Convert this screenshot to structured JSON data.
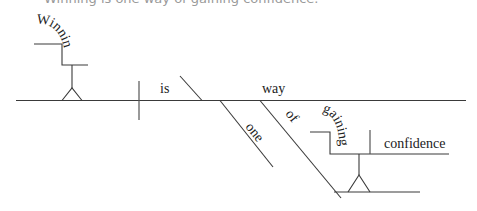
{
  "caption": "Winning is one way of gaining confidence.",
  "diagram": {
    "type": "sentence-diagram",
    "subject_gerund": "Winning",
    "verb": "is",
    "complement": "way",
    "modifiers": {
      "one": "one",
      "preposition": "of",
      "object_gerund": "gaining",
      "gerund_object": "confidence"
    }
  },
  "colors": {
    "line": "#3a3a3a",
    "text": "#222222",
    "caption": "#9a9a9a"
  }
}
